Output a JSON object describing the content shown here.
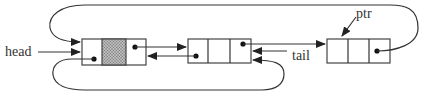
{
  "diagram": {
    "type": "circular-doubly-linked-list",
    "labels": {
      "head": "head",
      "tail": "tail",
      "ptr": "ptr"
    },
    "nodes": [
      {
        "id": "node-1",
        "cells": [
          "prev",
          "data",
          "next"
        ],
        "data_cell_shaded": true
      },
      {
        "id": "node-2",
        "cells": [
          "prev",
          "data",
          "next"
        ],
        "data_cell_shaded": false
      },
      {
        "id": "node-3",
        "cells": [
          "prev",
          "data",
          "next"
        ],
        "data_cell_shaded": false
      }
    ],
    "edges": [
      {
        "from": "node-1.next",
        "to": "node-2"
      },
      {
        "from": "node-2.prev",
        "to": "node-1"
      },
      {
        "from": "node-2.next",
        "to": "node-3"
      },
      {
        "from": "node-3.next",
        "to": "node-1",
        "route": "top-loop"
      },
      {
        "from": "node-1.prev",
        "to": "node-2",
        "route": "bottom-loop"
      },
      {
        "from": "head",
        "to": "node-1"
      },
      {
        "from": "tail",
        "to": "node-2"
      },
      {
        "from": "ptr",
        "to": "node-3"
      }
    ],
    "colors": {
      "line": "#333333",
      "shade": "#9a9a9a"
    }
  }
}
